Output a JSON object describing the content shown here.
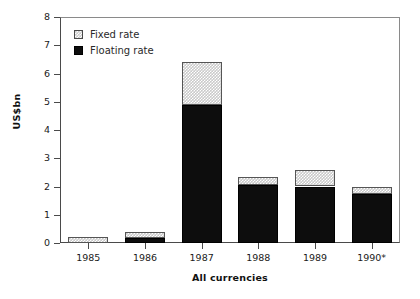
{
  "chart_data": {
    "type": "bar",
    "title": "",
    "subtitle": "",
    "xlabel": "All currencies",
    "ylabel": "US$bn",
    "categories": [
      "1985",
      "1986",
      "1987",
      "1988",
      "1989",
      "1990*"
    ],
    "stacked": true,
    "series": [
      {
        "name": "Floating rate",
        "values": [
          0.0,
          0.18,
          4.9,
          2.05,
          2.0,
          1.75
        ]
      },
      {
        "name": "Fixed rate",
        "values": [
          0.2,
          0.22,
          1.5,
          0.3,
          0.6,
          0.25
        ]
      }
    ],
    "totals": [
      0.2,
      0.4,
      6.4,
      2.35,
      2.6,
      2.0
    ],
    "ylim": [
      0,
      8
    ],
    "yticks": [
      0,
      1,
      2,
      3,
      4,
      5,
      6,
      7,
      8
    ],
    "ytick_labels": [
      "0",
      "1",
      "2",
      "3",
      "4",
      "5",
      "6",
      "7",
      "8"
    ],
    "grid": false,
    "legend_position": "top-left",
    "legend": [
      "Fixed rate",
      "Floating rate"
    ],
    "colors": {
      "fixed_rate": "#c9c9c9",
      "floating_rate": "#0d0d0d",
      "axis": "#4a4a4a",
      "background": "#ffffff"
    }
  },
  "legend": {
    "fixed_label": "Fixed rate",
    "floating_label": "Floating rate"
  },
  "axes": {
    "y_title": "US$bn",
    "x_title": "All currencies"
  }
}
